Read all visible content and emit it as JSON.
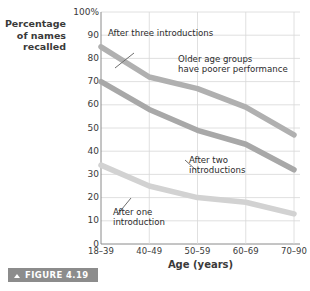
{
  "figure": {
    "badge_label": "FIGURE 4.19",
    "badge_icon": "chevron-up-icon",
    "badge_color": "#8c8c8c"
  },
  "axes": {
    "y_title": "Percentage\nof names\nrecalled",
    "x_title": "Age (years)",
    "y_ticks": [
      "100%",
      "90",
      "80",
      "70",
      "60",
      "50",
      "40",
      "30",
      "20",
      "10",
      "0"
    ],
    "x_ticks": [
      "18–39",
      "40–49",
      "50–59",
      "60–69",
      "70–90"
    ]
  },
  "annotations": {
    "three": "After three introductions",
    "older": "Older age groups\nhave poorer performance",
    "two": "After two\nintroductions",
    "one": "After one\nintroduction"
  },
  "chart_data": {
    "type": "line",
    "title": "",
    "xlabel": "Age (years)",
    "ylabel": "Percentage of names recalled",
    "categories": [
      "18–39",
      "40–49",
      "50–59",
      "60–69",
      "70–90"
    ],
    "ylim": [
      0,
      100
    ],
    "yticks": [
      0,
      10,
      20,
      30,
      40,
      50,
      60,
      70,
      80,
      90,
      100
    ],
    "grid": true,
    "legend": "none",
    "series": [
      {
        "name": "After three introductions",
        "values": [
          85,
          72,
          67,
          59,
          47
        ],
        "color": "#b0b0b0"
      },
      {
        "name": "After two introductions",
        "values": [
          70,
          58,
          49,
          43,
          32
        ],
        "color": "#a8a8a8"
      },
      {
        "name": "After one introduction",
        "values": [
          34,
          25,
          20,
          18,
          13
        ],
        "color": "#d2d2d2"
      }
    ],
    "notes": [
      "Older age groups have poorer performance"
    ]
  }
}
